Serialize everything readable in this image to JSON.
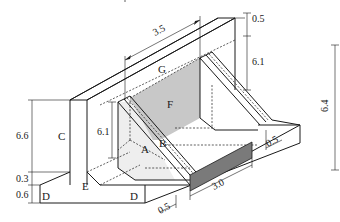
{
  "diagram": {
    "type": "isometric-structural-drawing",
    "labels": {
      "A": "A",
      "B": "B",
      "C": "C",
      "D_left": "D",
      "D_right": "D",
      "E": "E",
      "F": "F",
      "G": "G"
    },
    "dimensions": {
      "top_span": "3.5",
      "wall_top_thickness": "0.5",
      "wall_height_right": "6.1",
      "overall_height": "6.4",
      "left_wall_height": "6.6",
      "base_step": "0.3",
      "base_thickness": "0.6",
      "inner_height": "6.1",
      "opening_width": "3.0",
      "base_edge_right": "0.5",
      "base_edge_front": "0.5"
    },
    "colors": {
      "line": "#1a1a1a",
      "panel_F_fill": "#c8c8c8",
      "opening_fill": "#7a7a7a",
      "triangle_fill": "#eeeeee"
    }
  }
}
